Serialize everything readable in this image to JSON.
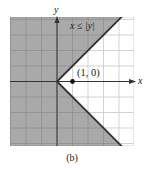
{
  "chart_data": {
    "type": "region",
    "title": "",
    "xlabel": "x",
    "ylabel": "y",
    "xlim": [
      -3,
      5
    ],
    "ylim": [
      -4.2,
      4.2
    ],
    "grid": true,
    "grid_step": 1,
    "region": {
      "inequality": "x ≤ |y|",
      "shaded": true,
      "boundary": [
        {
          "from": [
            0,
            0
          ],
          "to": [
            4.2,
            4.2
          ]
        },
        {
          "from": [
            0,
            0
          ],
          "to": [
            4.2,
            -4.2
          ]
        }
      ]
    },
    "annotations": [
      {
        "text": "x ≤ |y|",
        "x": 2.0,
        "y": 3.6
      },
      {
        "text": "(1, 0)",
        "x": 1.0,
        "y": 0,
        "marker": "dot"
      }
    ],
    "test_point": {
      "x": 1,
      "y": 0,
      "label": "(1, 0)"
    }
  },
  "figure": {
    "caption": "(b)",
    "inequality_label": "x ≤ |y|",
    "point_label": "(1, 0)",
    "x_axis_label": "x",
    "y_axis_label": "y"
  },
  "colors": {
    "shade": "#a9a9a9",
    "grid_on_shade": "#8f8f8f",
    "grid_on_white": "#c8c8c8",
    "axis": "#333333",
    "boundary": "#333333",
    "point": "#111111"
  }
}
